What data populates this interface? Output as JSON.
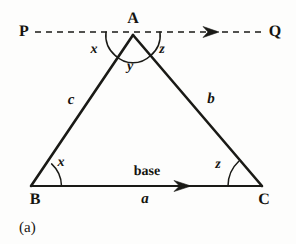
{
  "figure": {
    "caption": "(a)",
    "caption_pos": {
      "x": 19,
      "y": 221
    },
    "stroke_color": "#1a1a16",
    "background_color": "#fdfdfc"
  },
  "vertices": [
    {
      "id": "A",
      "label": "A",
      "point": {
        "x": 133,
        "y": 35
      },
      "label_pos": {
        "x": 133,
        "y": 19
      }
    },
    {
      "id": "B",
      "label": "B",
      "point": {
        "x": 31,
        "y": 186
      },
      "label_pos": {
        "x": 35,
        "y": 200
      }
    },
    {
      "id": "C",
      "label": "C",
      "point": {
        "x": 262,
        "y": 186
      },
      "label_pos": {
        "x": 264,
        "y": 200
      }
    }
  ],
  "dashed_line": {
    "start_label": "P",
    "end_label": "Q",
    "start_label_pos": {
      "x": 24,
      "y": 32
    },
    "end_label_pos": {
      "x": 275,
      "y": 32
    },
    "y": 32,
    "x_start": 35,
    "x_end": 265,
    "arrow_x": 212,
    "dash_pattern": "6 5"
  },
  "angle_labels": [
    {
      "name": "apex-left",
      "text": "x",
      "pos": {
        "x": 94,
        "y": 50
      }
    },
    {
      "name": "apex-right",
      "text": "z",
      "pos": {
        "x": 162,
        "y": 50
      }
    },
    {
      "name": "apex-interior",
      "text": "y",
      "pos": {
        "x": 130,
        "y": 67
      }
    },
    {
      "name": "vertex-b",
      "text": "x",
      "pos": {
        "x": 61,
        "y": 163
      }
    },
    {
      "name": "vertex-c",
      "text": "z",
      "pos": {
        "x": 218,
        "y": 165
      }
    }
  ],
  "side_labels": [
    {
      "name": "side-ab",
      "text": "c",
      "pos": {
        "x": 71,
        "y": 100
      }
    },
    {
      "name": "side-ac",
      "text": "b",
      "pos": {
        "x": 211,
        "y": 99
      }
    },
    {
      "name": "side-bc",
      "text": "a",
      "pos": {
        "x": 145,
        "y": 199
      }
    }
  ],
  "base_label": {
    "text": "base",
    "pos": {
      "x": 147,
      "y": 172
    }
  },
  "base_arrow_x": 184
}
